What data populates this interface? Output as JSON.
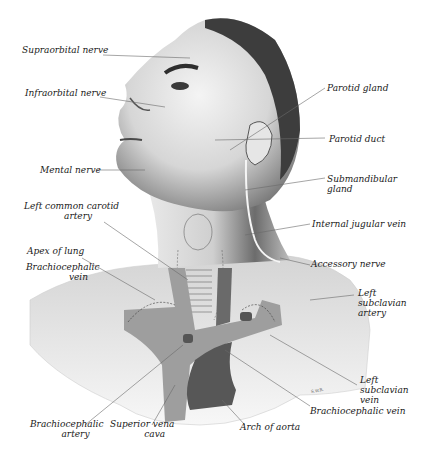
{
  "figure": {
    "signature": "S.W.R.",
    "colors": {
      "skin_light": "#f2f2f2",
      "skin_mid": "#bdbdbd",
      "skin_dark": "#5a5a5a",
      "hair": "#3a3a3a",
      "vein": "#9c9c9c",
      "artery": "#555555",
      "leader": "#6a6a6a"
    }
  },
  "labels": {
    "supraorbital_nerve": "Supraorbital nerve",
    "infraorbital_nerve": "Infraorbital nerve",
    "mental_nerve": "Mental nerve",
    "left_common_carotid_artery": "Left common carotid\n              artery",
    "apex_of_lung": "Apex of lung",
    "brachiocephalic_vein_left": "Brachiocephalic\n               vein",
    "parotid_gland": "Parotid gland",
    "parotid_duct": "Parotid duct",
    "submandibular_gland": "Submandibular\ngland",
    "internal_jugular_vein": "Internal jugular vein",
    "accessory_nerve": "Accessory nerve",
    "left_subclavian_artery": "Left\nsubclavian\nartery",
    "left_subclavian_vein": "Left\nsubclavian\nvein",
    "brachiocephalic_vein_right": "Brachiocephalic vein",
    "brachiocephalic_artery": "Brachiocephalic\n           artery",
    "superior_vena_cava": "Superior vena\n            cava",
    "arch_of_aorta": "Arch of aorta"
  }
}
